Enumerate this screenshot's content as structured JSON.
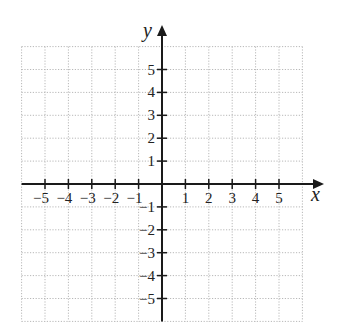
{
  "chart_data": {
    "type": "scatter",
    "title": "",
    "xlabel": "x",
    "ylabel": "y",
    "xlim": [
      -6,
      6
    ],
    "ylim": [
      -6,
      6
    ],
    "grid": true,
    "x_ticks": [
      -5,
      -4,
      -3,
      -2,
      -1,
      1,
      2,
      3,
      4,
      5
    ],
    "y_ticks": [
      5,
      4,
      3,
      2,
      1,
      -1,
      -2,
      -3,
      -4,
      -5
    ],
    "x_tick_labels": [
      "−5",
      "−4",
      "−3",
      "−2",
      "−1",
      "1",
      "2",
      "3",
      "4",
      "5"
    ],
    "y_tick_labels": [
      "5",
      "4",
      "3",
      "2",
      "1",
      "−1",
      "−2",
      "−3",
      "−4",
      "−5"
    ],
    "series": [],
    "legend": null
  },
  "colors": {
    "axis": "#1a1a1a",
    "grid": "#b8b8b8",
    "background": "#ffffff"
  }
}
